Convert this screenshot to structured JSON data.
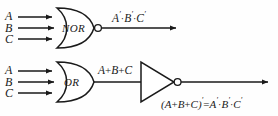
{
  "figure": {
    "background_color": "#fefefe",
    "line_color": "#1a1a1a"
  },
  "circuits": [
    {
      "id": "nor-circuit",
      "gate_label": "NOR",
      "inputs": [
        {
          "label": "A"
        },
        {
          "label": "B"
        },
        {
          "label": "C"
        }
      ],
      "output_expression": {
        "parts": [
          {
            "text": "A",
            "type": "var"
          },
          {
            "text": "′",
            "type": "prime"
          },
          {
            "text": "·",
            "type": "op"
          },
          {
            "text": "B",
            "type": "var"
          },
          {
            "text": "′",
            "type": "prime"
          },
          {
            "text": "·",
            "type": "op"
          },
          {
            "text": "C",
            "type": "var"
          },
          {
            "text": "′",
            "type": "prime"
          }
        ],
        "plain": "A′·B′·C′"
      },
      "has_output_bubble": true
    },
    {
      "id": "or-inverter-circuit",
      "gate_label": "OR",
      "inputs": [
        {
          "label": "A"
        },
        {
          "label": "B"
        },
        {
          "label": "C"
        }
      ],
      "intermediate_expression": {
        "plain": "A+B+C"
      },
      "output_expression": {
        "plain": "(A+B+C)′ = A′·B′·C′"
      },
      "has_inverter": true,
      "has_inverter_bubble": true
    }
  ]
}
